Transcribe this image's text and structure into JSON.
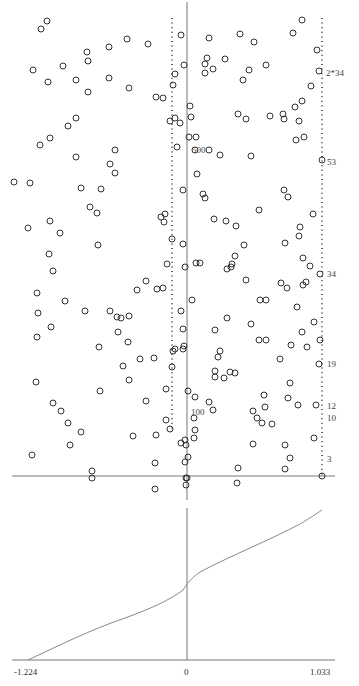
{
  "chart_data": [
    {
      "type": "scatter",
      "title": "",
      "xlabel": "",
      "ylabel": "",
      "description": "Scatter of hollow circles with a vertical reference line at x=0, a dotted vertical line slightly left of 0 and a dotted vertical line at the right edge; a horizontal axis line near the bottom.",
      "grid": false,
      "annotations": [
        {
          "text": "2*34",
          "x_px": 326,
          "y_px": 73
        },
        {
          "text": "53",
          "x_px": 327,
          "y_px": 162
        },
        {
          "text": "34",
          "x_px": 327,
          "y_px": 274
        },
        {
          "text": "19",
          "x_px": 327,
          "y_px": 364
        },
        {
          "text": "12",
          "x_px": 327,
          "y_px": 406
        },
        {
          "text": "10",
          "x_px": 327,
          "y_px": 418
        },
        {
          "text": "3",
          "x_px": 327,
          "y_px": 459
        },
        {
          "text": "500",
          "x_px": 192,
          "y_px": 150
        },
        {
          "text": "100",
          "x_px": 191,
          "y_px": 412
        }
      ],
      "points_px": [
        [
          47,
          21
        ],
        [
          41,
          29
        ],
        [
          33,
          70
        ],
        [
          87,
          52
        ],
        [
          88,
          61
        ],
        [
          109,
          47
        ],
        [
          127,
          39
        ],
        [
          148,
          44
        ],
        [
          181,
          35
        ],
        [
          184,
          65
        ],
        [
          209,
          38
        ],
        [
          225,
          59
        ],
        [
          240,
          34
        ],
        [
          254,
          42
        ],
        [
          266,
          65
        ],
        [
          293,
          33
        ],
        [
          302,
          20
        ],
        [
          317,
          50
        ],
        [
          319,
          71
        ],
        [
          88,
          92
        ],
        [
          48,
          82
        ],
        [
          63,
          66
        ],
        [
          76,
          80
        ],
        [
          109,
          78
        ],
        [
          129,
          88
        ],
        [
          207,
          58
        ],
        [
          205,
          64
        ],
        [
          205,
          73
        ],
        [
          213,
          69
        ],
        [
          243,
          80
        ],
        [
          249,
          70
        ],
        [
          175,
          74
        ],
        [
          173,
          85
        ],
        [
          175,
          118
        ],
        [
          191,
          117
        ],
        [
          190,
          106
        ],
        [
          163,
          98
        ],
        [
          156,
          97
        ],
        [
          170,
          121
        ],
        [
          180,
          123
        ],
        [
          177,
          147
        ],
        [
          189,
          137
        ],
        [
          195,
          150
        ],
        [
          196,
          137
        ],
        [
          209,
          150
        ],
        [
          220,
          155
        ],
        [
          251,
          156
        ],
        [
          283,
          114
        ],
        [
          284,
          119
        ],
        [
          295,
          107
        ],
        [
          299,
          121
        ],
        [
          302,
          101
        ],
        [
          270,
          116
        ],
        [
          238,
          114
        ],
        [
          246,
          119
        ],
        [
          296,
          140
        ],
        [
          304,
          137
        ],
        [
          311,
          86
        ],
        [
          322,
          160
        ],
        [
          76,
          118
        ],
        [
          68,
          126
        ],
        [
          50,
          138
        ],
        [
          40,
          145
        ],
        [
          76,
          157
        ],
        [
          115,
          150
        ],
        [
          110,
          164
        ],
        [
          115,
          173
        ],
        [
          81,
          188
        ],
        [
          90,
          207
        ],
        [
          97,
          213
        ],
        [
          101,
          189
        ],
        [
          30,
          183
        ],
        [
          14,
          182
        ],
        [
          28,
          228
        ],
        [
          50,
          221
        ],
        [
          161,
          217
        ],
        [
          164,
          222
        ],
        [
          165,
          214
        ],
        [
          183,
          190
        ],
        [
          197,
          174
        ],
        [
          203,
          194
        ],
        [
          205,
          198
        ],
        [
          214,
          219
        ],
        [
          226,
          221
        ],
        [
          284,
          190
        ],
        [
          288,
          197
        ],
        [
          313,
          214
        ],
        [
          299,
          236
        ],
        [
          300,
          227
        ],
        [
          259,
          210
        ],
        [
          236,
          226
        ],
        [
          244,
          245
        ],
        [
          285,
          243
        ],
        [
          303,
          258
        ],
        [
          281,
          283
        ],
        [
          60,
          233
        ],
        [
          98,
          245
        ],
        [
          49,
          254
        ],
        [
          53,
          271
        ],
        [
          37,
          293
        ],
        [
          65,
          301
        ],
        [
          85,
          311
        ],
        [
          110,
          311
        ],
        [
          117,
          317
        ],
        [
          121,
          318
        ],
        [
          129,
          316
        ],
        [
          137,
          290
        ],
        [
          146,
          281
        ],
        [
          157,
          289
        ],
        [
          163,
          288
        ],
        [
          167,
          264
        ],
        [
          172,
          239
        ],
        [
          183,
          244
        ],
        [
          185,
          267
        ],
        [
          200,
          263
        ],
        [
          196,
          263
        ],
        [
          227,
          269
        ],
        [
          231,
          267
        ],
        [
          235,
          256
        ],
        [
          232,
          264
        ],
        [
          246,
          280
        ],
        [
          260,
          300
        ],
        [
          266,
          300
        ],
        [
          287,
          288
        ],
        [
          303,
          285
        ],
        [
          306,
          282
        ],
        [
          310,
          266
        ],
        [
          320,
          274
        ],
        [
          297,
          307
        ],
        [
          227,
          318
        ],
        [
          259,
          340
        ],
        [
          291,
          345
        ],
        [
          314,
          322
        ],
        [
          302,
          332
        ],
        [
          181,
          311
        ],
        [
          183,
          329
        ],
        [
          183,
          349
        ],
        [
          184,
          346
        ],
        [
          192,
          300
        ],
        [
          215,
          330
        ],
        [
          220,
          351
        ],
        [
          218,
          357
        ],
        [
          251,
          324
        ],
        [
          266,
          340
        ],
        [
          280,
          359
        ],
        [
          320,
          340
        ],
        [
          175,
          349
        ],
        [
          173,
          351
        ],
        [
          118,
          332
        ],
        [
          128,
          342
        ],
        [
          99,
          347
        ],
        [
          38,
          313
        ],
        [
          37,
          337
        ],
        [
          51,
          327
        ],
        [
          36,
          382
        ],
        [
          53,
          403
        ],
        [
          61,
          411
        ],
        [
          68,
          423
        ],
        [
          81,
          432
        ],
        [
          70,
          445
        ],
        [
          32,
          455
        ],
        [
          123,
          366
        ],
        [
          100,
          391
        ],
        [
          129,
          380
        ],
        [
          146,
          401
        ],
        [
          133,
          436
        ],
        [
          156,
          435
        ],
        [
          170,
          429
        ],
        [
          166,
          389
        ],
        [
          140,
          359
        ],
        [
          154,
          358
        ],
        [
          166,
          420
        ],
        [
          172,
          367
        ],
        [
          195,
          397
        ],
        [
          194,
          418
        ],
        [
          209,
          402
        ],
        [
          213,
          410
        ],
        [
          215,
          371
        ],
        [
          215,
          377
        ],
        [
          235,
          373
        ],
        [
          230,
          372
        ],
        [
          224,
          378
        ],
        [
          264,
          395
        ],
        [
          265,
          407
        ],
        [
          272,
          424
        ],
        [
          288,
          398
        ],
        [
          290,
          383
        ],
        [
          298,
          405
        ],
        [
          285,
          445
        ],
        [
          290,
          458
        ],
        [
          285,
          469
        ],
        [
          307,
          347
        ],
        [
          319,
          364
        ],
        [
          316,
          405
        ],
        [
          314,
          438
        ],
        [
          257,
          418
        ],
        [
          262,
          423
        ],
        [
          253,
          411
        ],
        [
          253,
          444
        ],
        [
          188,
          391
        ],
        [
          181,
          443
        ],
        [
          185,
          440
        ],
        [
          186,
          445
        ],
        [
          194,
          438
        ],
        [
          195,
          430
        ],
        [
          185,
          462
        ],
        [
          186,
          478
        ],
        [
          186,
          485
        ],
        [
          188,
          457
        ],
        [
          187,
          478
        ],
        [
          155,
          463
        ],
        [
          155,
          489
        ],
        [
          92,
          471
        ],
        [
          92,
          478
        ],
        [
          238,
          468
        ],
        [
          237,
          483
        ],
        [
          322,
          476
        ]
      ]
    },
    {
      "type": "line",
      "title": "",
      "xlabel": "",
      "ylabel": "",
      "x_ticks": [
        "-1.224",
        "0",
        "1.033"
      ],
      "xlim": [
        -1.224,
        1.033
      ],
      "grid": false,
      "description": "Monotonically increasing curve; crosses the vertical zero line near mid-height, with a slight inflection there.",
      "series": [
        {
          "name": "curve",
          "x": [
            -1.224,
            -1.0,
            -0.75,
            -0.5,
            -0.25,
            -0.1,
            0.0,
            0.1,
            0.25,
            0.5,
            0.75,
            1.033
          ],
          "y_rel": [
            0.0,
            0.08,
            0.17,
            0.25,
            0.33,
            0.39,
            0.46,
            0.55,
            0.62,
            0.73,
            0.85,
            1.0
          ]
        }
      ]
    }
  ],
  "axes": {
    "bottom_ticks": {
      "left": "-1.224",
      "center": "0",
      "right": "1.033"
    }
  },
  "labels": {
    "l_2x34": "2*34",
    "l_53": "53",
    "l_34": "34",
    "l_19": "19",
    "l_12": "12",
    "l_10": "10",
    "l_3": "3",
    "l_500": "500",
    "l_100": "100"
  }
}
